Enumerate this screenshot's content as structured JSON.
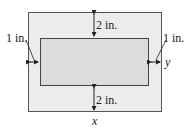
{
  "diagram": {
    "labels": {
      "top_margin": "2 in.",
      "bottom_margin": "2 in.",
      "left_margin": "1 in.",
      "right_margin": "1 in.",
      "width_var": "x",
      "height_var": "y"
    },
    "colors": {
      "outer_fill": "#ececec",
      "inner_fill": "#dcdcdc",
      "stroke": "#444444"
    }
  }
}
